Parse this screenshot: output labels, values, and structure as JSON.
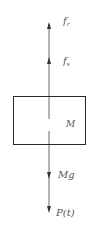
{
  "diagram": {
    "type": "free-body-diagram",
    "colors": {
      "line": "#6a6a6a",
      "box": "#2a2a2a",
      "text": "#555555",
      "background": "#ffffff"
    },
    "body": {
      "label": "M"
    },
    "forces": [
      {
        "id": "f1",
        "label": "f",
        "subscript": "r",
        "direction": "up"
      },
      {
        "id": "f2",
        "label": "f",
        "subscript": "s",
        "direction": "up"
      },
      {
        "id": "weight",
        "label": "Mg",
        "direction": "down"
      },
      {
        "id": "load",
        "label": "P(t)",
        "direction": "down"
      }
    ]
  }
}
